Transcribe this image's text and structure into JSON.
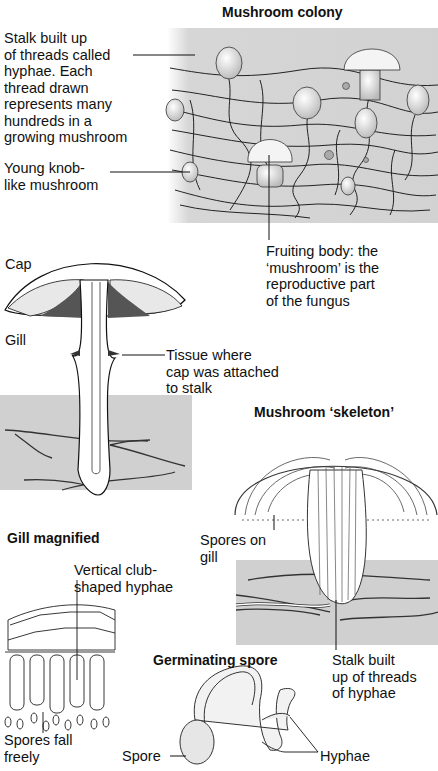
{
  "sections": {
    "colony": {
      "title": "Mushroom colony",
      "labels": {
        "stalk_threads": "Stalk built up\nof threads called\nhyphae. Each\nthread drawn\nrepresents many\nhundreds in a\ngrowing mushroom",
        "young_knob": "Young knob-\nlike mushroom",
        "fruiting_body": "Fruiting body: the\n‘mushroom’ is the\nreproductive part\nof the fungus"
      }
    },
    "mushroom_section": {
      "labels": {
        "cap": "Cap",
        "gill": "Gill",
        "tissue": "Tissue where\ncap was attached\nto stalk"
      }
    },
    "skeleton": {
      "title": "Mushroom ‘skeleton’",
      "labels": {
        "spores_on_gill": "Spores on\ngill",
        "stalk_hyphae": "Stalk built\nup of threads\nof hyphae"
      }
    },
    "gill_magnified": {
      "title": "Gill magnified",
      "labels": {
        "club_hyphae": "Vertical club-\nshaped hyphae",
        "spores_fall": "Spores fall\nfreely"
      }
    },
    "germinating_spore": {
      "title": "Germinating spore",
      "labels": {
        "spore": "Spore",
        "hyphae": "Hyphae"
      }
    }
  },
  "colors": {
    "ground": "#cfcfcf",
    "ink": "#111111",
    "paper": "#ffffff"
  }
}
